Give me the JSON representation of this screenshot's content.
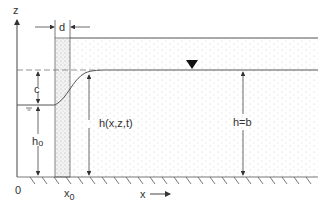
{
  "diagram": {
    "labels": {
      "z_axis": "z",
      "origin": "0",
      "x_axis": "x",
      "x0": "x",
      "x0_sub": "0",
      "wall_thickness": "d",
      "drawdown": "c",
      "h0": "h",
      "h0_sub": "o",
      "head_var": "h(x,z,t)",
      "head_far": "h=b"
    },
    "colors": {
      "line": "#555555",
      "wall_fill": "#ececec",
      "stipple": "#b5b5b5",
      "text": "#333333"
    }
  }
}
